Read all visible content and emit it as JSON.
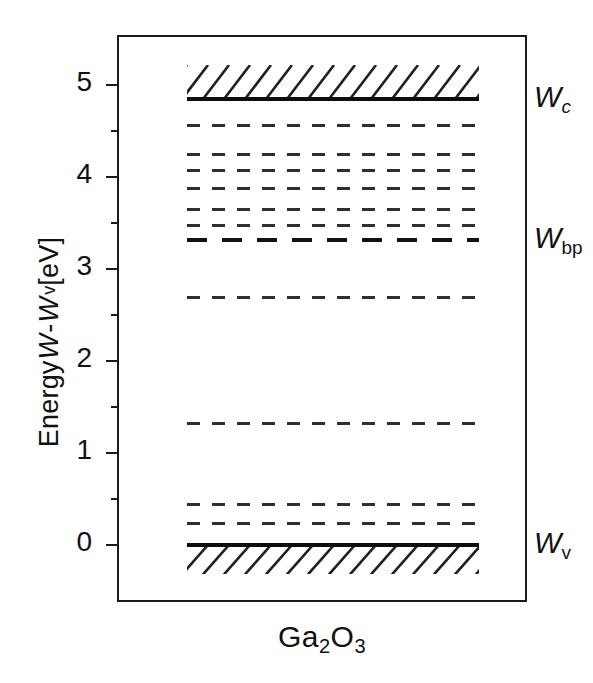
{
  "figure": {
    "caption": "Ga2O3",
    "caption_parts": {
      "a": "Ga",
      "s1": "2",
      "b": "O",
      "s2": "3"
    },
    "material": "Ga2O3"
  },
  "yaxis": {
    "title_prefix": "Energy ",
    "title_w1": "W",
    "title_minus": " - ",
    "title_w2": "W",
    "title_w2_sub": "v",
    "title_unit": " [eV]",
    "unit": "eV",
    "min": -0.35,
    "max": 5.4,
    "ticks_major": [
      "0",
      "1",
      "2",
      "3",
      "4",
      "5"
    ],
    "tick_major_values": [
      0,
      1,
      2,
      3,
      4,
      5
    ],
    "tick_minor_values": [
      0.5,
      1.5,
      2.5,
      3.5,
      4.5
    ]
  },
  "band_edges": [
    {
      "name": "Wc",
      "label_w": "W",
      "label_sub": "c",
      "sub_italic": true,
      "energy": 4.85,
      "style": "solid"
    },
    {
      "name": "Wbp",
      "label_w": "W",
      "label_sub": "bp",
      "sub_italic": false,
      "energy": 3.32,
      "style": "bold-dashed"
    },
    {
      "name": "Wv",
      "label_w": "W",
      "label_sub": "v",
      "sub_italic": false,
      "energy": 0.0,
      "style": "solid"
    }
  ],
  "levels": [
    {
      "label": "E7",
      "energy": 4.56,
      "style": "thin-dashed"
    },
    {
      "label": "E1",
      "energy": 4.25,
      "style": "thin-dashed"
    },
    {
      "label": "E2",
      "energy": 4.07,
      "style": "thin-dashed"
    },
    {
      "label": "E3",
      "energy": 3.87,
      "style": "thin-dashed"
    },
    {
      "label": "E4",
      "energy": 3.65,
      "style": "thin-dashed"
    },
    {
      "label": "",
      "energy": 3.47,
      "style": "thin-dashed"
    },
    {
      "label": "H7",
      "energy": 3.32,
      "style": "bold-dashed"
    },
    {
      "label": "H4",
      "energy": 2.69,
      "style": "thin-dashed"
    },
    {
      "label": "H3",
      "energy": 1.32,
      "style": "thin-dashed"
    },
    {
      "label": "H6",
      "energy": 0.44,
      "style": "thin-dashed"
    },
    {
      "label": "H1",
      "energy": 0.23,
      "style": "thin-dashed"
    }
  ],
  "hatched_regions": [
    {
      "name": "conduction-band",
      "from": 4.85,
      "to": 5.22
    },
    {
      "name": "valence-band",
      "from": -0.32,
      "to": 0.0
    }
  ],
  "chart_data": {
    "type": "table",
    "xlabel": "Ga2O3",
    "ylabel": "Energy W - Wv [eV]",
    "ylim": [
      -0.35,
      5.4
    ],
    "grid": false,
    "legend": "none",
    "categories": [
      "Wc",
      "E7",
      "E1",
      "E2",
      "E3",
      "E4",
      "E4b",
      "H7/Wbp",
      "H4",
      "H3",
      "H6",
      "H1",
      "Wv"
    ],
    "values": [
      4.85,
      4.56,
      4.25,
      4.07,
      3.87,
      3.65,
      3.47,
      3.32,
      2.69,
      1.32,
      0.44,
      0.23,
      0.0
    ],
    "annotations": [
      "Wc",
      "Wbp",
      "Wv"
    ]
  },
  "colors": {
    "frame": "#1a1a1a",
    "level_thin": "#2f2f2f",
    "level_bold": "#111111",
    "band_edge": "#0d0d0d",
    "text": "#111111",
    "level_text": "#3a3a3a",
    "background": "#ffffff"
  }
}
